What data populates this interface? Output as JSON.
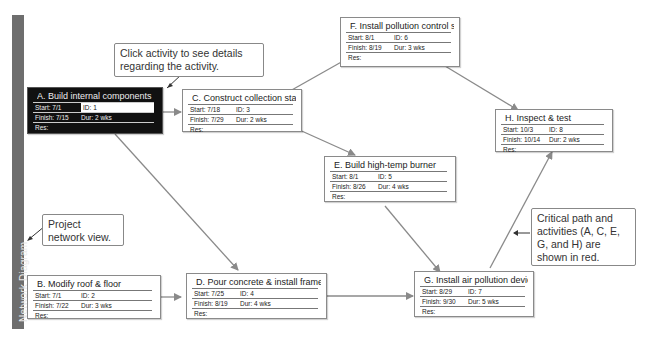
{
  "sidebar": {
    "label": "Network Diagram"
  },
  "colors": {
    "selected_bg": "#111111",
    "sidebar": "#6e6e6e",
    "link": "#8a8a8a"
  },
  "labels": {
    "start": "Start:",
    "finish": "Finish:",
    "id": "ID:",
    "dur": "Dur:",
    "res": "Res:"
  },
  "nodes": [
    {
      "key": "A",
      "title": "A. Build internal components",
      "start": "7/1",
      "finish": "7/15",
      "id": "1",
      "dur": "2 wks",
      "res": "",
      "selected": true
    },
    {
      "key": "B",
      "title": "B. Modify roof & floor",
      "start": "7/1",
      "finish": "7/22",
      "id": "2",
      "dur": "3 wks",
      "res": ""
    },
    {
      "key": "C",
      "title": "C. Construct collection stack",
      "start": "7/18",
      "finish": "7/29",
      "id": "3",
      "dur": "2 wks",
      "res": ""
    },
    {
      "key": "D",
      "title": "D. Pour concrete & install frame",
      "start": "7/25",
      "finish": "8/19",
      "id": "4",
      "dur": "4 wks",
      "res": ""
    },
    {
      "key": "E",
      "title": "E. Build high-temp burner",
      "start": "8/1",
      "finish": "8/26",
      "id": "5",
      "dur": "4 wks",
      "res": ""
    },
    {
      "key": "F",
      "title": "F. Install pollution control system",
      "start": "8/1",
      "finish": "8/19",
      "id": "6",
      "dur": "3 wks",
      "res": ""
    },
    {
      "key": "G",
      "title": "G. Install air pollution device",
      "start": "8/29",
      "finish": "9/30",
      "id": "7",
      "dur": "5 wks",
      "res": ""
    },
    {
      "key": "H",
      "title": "H. Inspect & test",
      "start": "10/3",
      "finish": "10/14",
      "id": "8",
      "dur": "2 wks",
      "res": ""
    }
  ],
  "callouts": {
    "click_activity": "Click activity to see details regarding the activity.",
    "network_view": "Project network view.",
    "critical_path": "Critical path and activities (A, C, E, G, and H) are shown in red."
  }
}
